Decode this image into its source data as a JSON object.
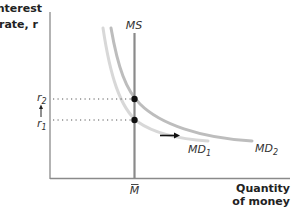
{
  "diagram": {
    "y_axis_title": [
      "Interest",
      "rate, r"
    ],
    "x_axis_title": [
      "Quantity",
      "of money"
    ],
    "money_supply_label": "MS",
    "md1_label": "MD",
    "md1_sub": "1",
    "md2_label": "MD",
    "md2_sub": "2",
    "r1_label": "r",
    "r1_sub": "1",
    "r2_label": "r",
    "r2_sub": "2",
    "m_bar_label": "M",
    "colors": {
      "axis": "#8a8a8a",
      "ms_line": "#8a8a8a",
      "md1": "#d8d8d8",
      "md2": "#bdbdbd",
      "dots": "#111111",
      "dotted_guides": "#555555",
      "arrow": "#111111"
    }
  }
}
